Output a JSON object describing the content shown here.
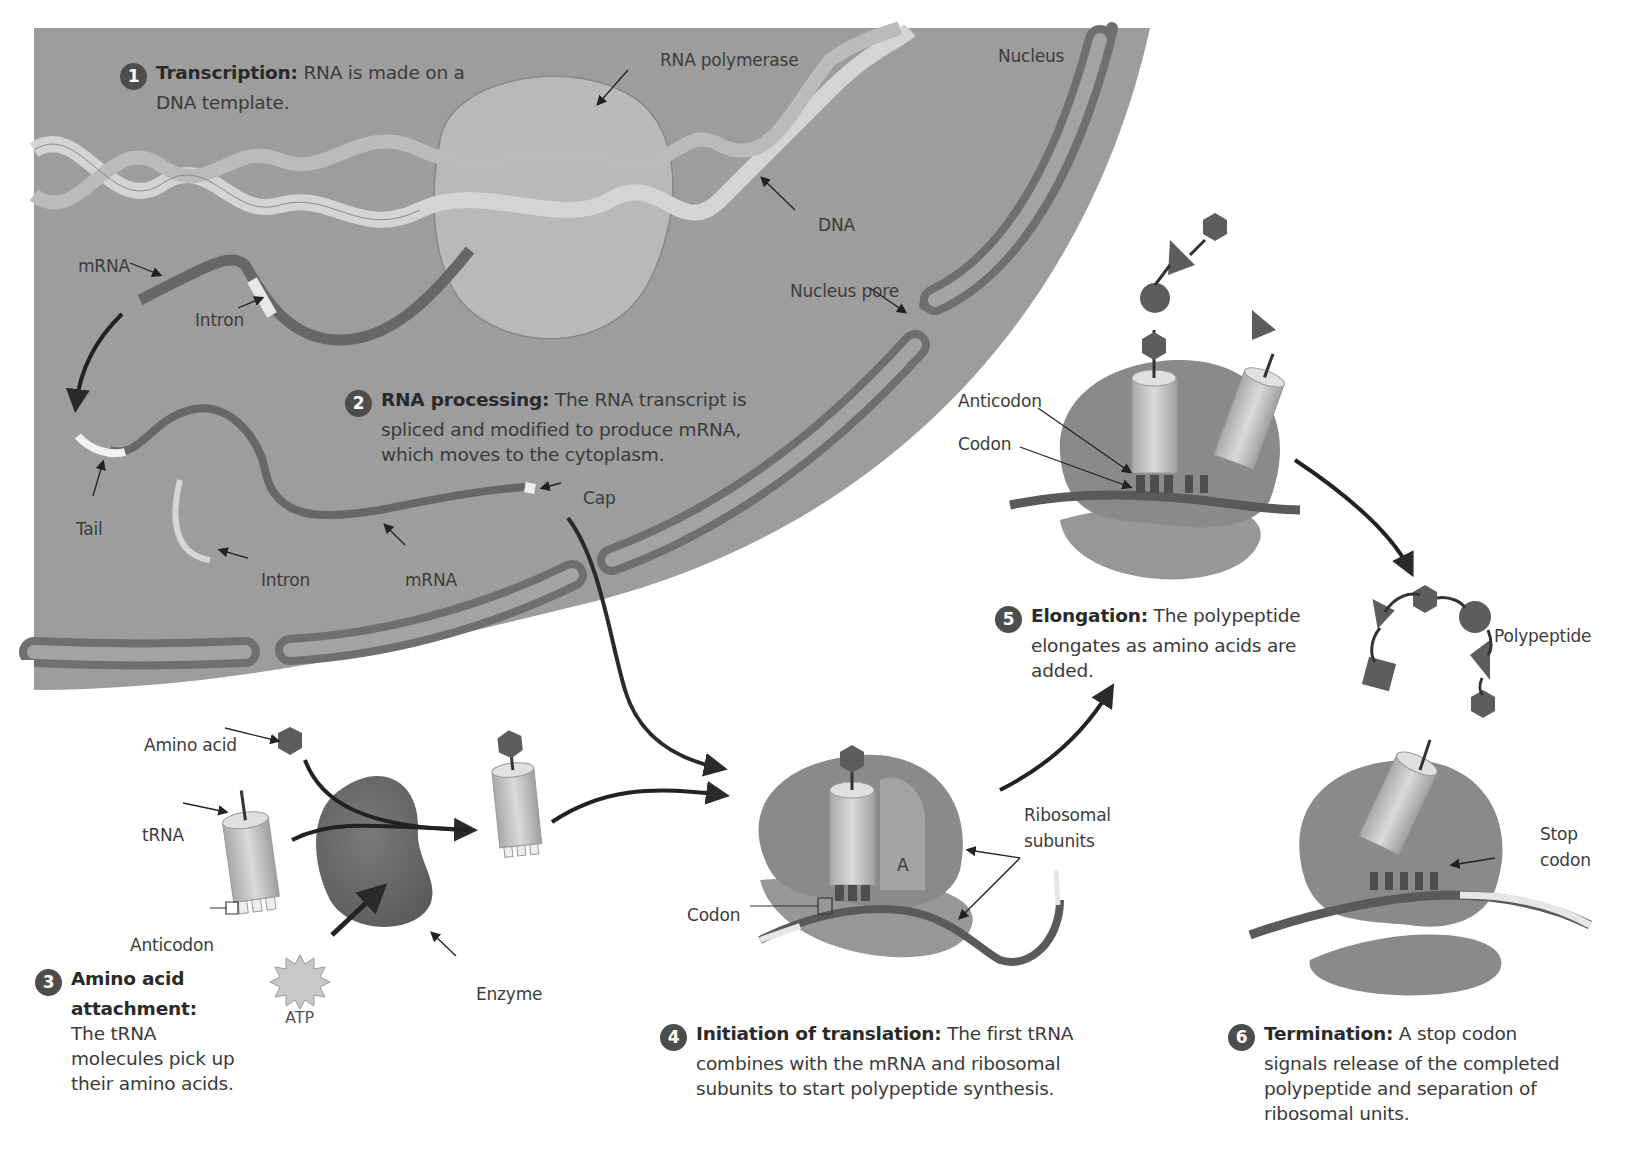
{
  "figure": {
    "colors": {
      "nucleus_fill": "#9d9d9d",
      "membrane": "#6f6f6f",
      "dna_ribbon": "#c9c9c9",
      "mrna": "#676767",
      "ribosome": "#8c8c8c",
      "trna": "#c4c4c4",
      "amino_acid": "#5d5d5d",
      "enzyme": "#6e6e6e",
      "step_badge": "#4d4d4d",
      "background": "#ffffff"
    }
  },
  "steps": [
    {
      "number": "1",
      "title": "Transcription:",
      "body_line1": "RNA is made on a",
      "body_line2": "DNA template."
    },
    {
      "number": "2",
      "title": "RNA processing:",
      "body_line1": "The RNA transcript is",
      "body_line2": "spliced and modified to produce mRNA,",
      "body_line3": "which moves to the cytoplasm."
    },
    {
      "number": "3",
      "title_line1": "Amino acid",
      "title_line2": "attachment:",
      "body_line1": "The tRNA",
      "body_line2": "molecules pick up",
      "body_line3": "their amino acids."
    },
    {
      "number": "4",
      "title": "Initiation of translation:",
      "body_line1": "The first tRNA",
      "body_line2": "combines with the mRNA and ribosomal",
      "body_line3": "subunits to start polypeptide synthesis."
    },
    {
      "number": "5",
      "title": "Elongation:",
      "body_line1": "The polypeptide",
      "body_line2": "elongates as amino acids are",
      "body_line3": "added."
    },
    {
      "number": "6",
      "title": "Termination:",
      "body_line1": "A stop codon",
      "body_line2": "signals release of the completed",
      "body_line3": "polypeptide and separation of",
      "body_line4": "ribosomal units."
    }
  ],
  "labels": {
    "rna_polymerase": "RNA polymerase",
    "nucleus": "Nucleus",
    "dna": "DNA",
    "mrna_top": "mRNA",
    "intron_top": "Intron",
    "nucleus_pore": "Nucleus pore",
    "tail": "Tail",
    "intron_bottom": "Intron",
    "mrna_bottom": "mRNA",
    "cap": "Cap",
    "anticodon_step5": "Anticodon",
    "codon_step5": "Codon",
    "polypeptide": "Polypeptide",
    "amino_acid": "Amino acid",
    "trna": "tRNA",
    "anticodon_step3": "Anticodon",
    "enzyme": "Enzyme",
    "atp": "ATP",
    "ribosomal_line1": "Ribosomal",
    "ribosomal_line2": "subunits",
    "a_site": "A",
    "codon_step4": "Codon",
    "stop_line1": "Stop",
    "stop_line2": "codon"
  }
}
